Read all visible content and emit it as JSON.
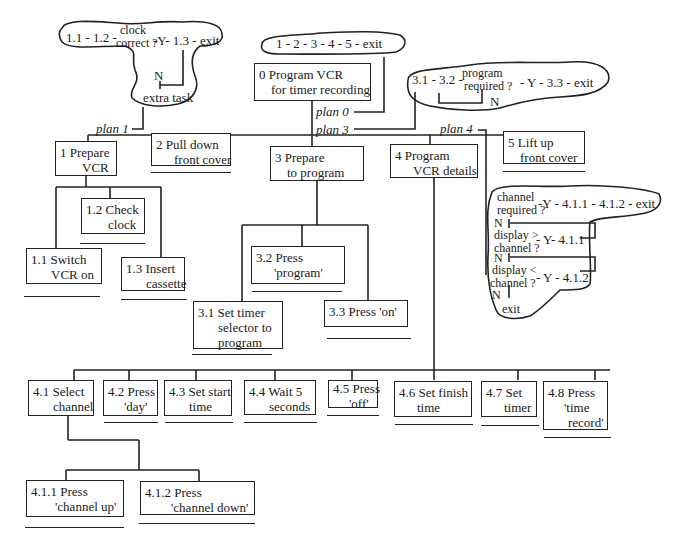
{
  "diagram": {
    "type": "hierarchical-task-analysis",
    "root": {
      "id": "0",
      "label_line1": "0  Program VCR",
      "label_line2": "for timer recording"
    },
    "plans": {
      "plan0": {
        "label": "plan 0",
        "text": "1 - 2 - 3 - 4 - 5 - exit"
      },
      "plan1": {
        "label": "plan 1",
        "seq": "1.1 - 1.2 -",
        "cond_line1": "clock",
        "cond_line2": "correct ?",
        "yes": "-Y- 1.3 - exit",
        "no": "N",
        "no_action": "extra task"
      },
      "plan3": {
        "label": "plan 3",
        "seq": "3.1 - 3.2 -",
        "cond_line1": "program",
        "cond_line2": "required ?",
        "yes": "- Y - 3.3 - exit",
        "no": "N"
      },
      "plan4": {
        "label": "plan 4"
      },
      "plan41": {
        "c1_line1": "channel",
        "c1_line2": "required ?",
        "c1_yes": "-Y - 4.1.1 - 4.1.2 - exit",
        "n1": "N",
        "c2_line1": "display >",
        "c2_line2": "channel ?",
        "c2_yes": "- Y- 4.1.1",
        "n2": "N",
        "c3_line1": "display <",
        "c3_line2": "channel ?",
        "c3_yes": "- Y - 4.1.2",
        "n3": "N",
        "exit": "exit"
      }
    },
    "level1": [
      {
        "id": "1",
        "line1": "1  Prepare",
        "line2": "VCR"
      },
      {
        "id": "2",
        "line1": "2  Pull down",
        "line2": "front cover"
      },
      {
        "id": "3",
        "line1": "3  Prepare",
        "line2": "to program"
      },
      {
        "id": "4",
        "line1": "4  Program",
        "line2": "VCR details"
      },
      {
        "id": "5",
        "line1": "5  Lift up",
        "line2": "front cover"
      }
    ],
    "task1": [
      {
        "id": "1.1",
        "line1": "1.1  Switch",
        "line2": "VCR on"
      },
      {
        "id": "1.2",
        "line1": "1.2  Check",
        "line2": "clock"
      },
      {
        "id": "1.3",
        "line1": "1.3  Insert",
        "line2": "cassette"
      }
    ],
    "task3": [
      {
        "id": "3.1",
        "line1": "3.1   Set timer",
        "line2": "selector to",
        "line3": "program"
      },
      {
        "id": "3.2",
        "line1": "3.2  Press",
        "line2": "'program'"
      },
      {
        "id": "3.3",
        "line1": "3.3  Press 'on'"
      }
    ],
    "task4": [
      {
        "id": "4.1",
        "line1": "4.1 Select",
        "line2": "channel"
      },
      {
        "id": "4.2",
        "line1": "4.2 Press",
        "line2": "'day'"
      },
      {
        "id": "4.3",
        "line1": "4.3 Set start",
        "line2": "time"
      },
      {
        "id": "4.4",
        "line1": "4.4 Wait 5",
        "line2": "seconds"
      },
      {
        "id": "4.5",
        "line1": "4.5 Press",
        "line2": "'off'"
      },
      {
        "id": "4.6",
        "line1": "4.6 Set finish",
        "line2": "time"
      },
      {
        "id": "4.7",
        "line1": "4.7 Set",
        "line2": "timer"
      },
      {
        "id": "4.8",
        "line1": "4.8 Press",
        "line2": "'time",
        "line3": "record'"
      }
    ],
    "task41": [
      {
        "id": "4.1.1",
        "line1": "4.1.1 Press",
        "line2": "'channel up'"
      },
      {
        "id": "4.1.2",
        "line1": "4.1.2 Press",
        "line2": "'channel down'"
      }
    ]
  }
}
